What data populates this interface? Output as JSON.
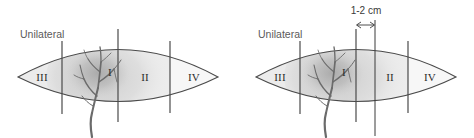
{
  "figure": {
    "type": "anatomical-zone-diagram",
    "background_color": "#ffffff",
    "outline_color": "#4a4a4a",
    "label_color": "#2b2b2b",
    "side_label_color": "#5a5a5a",
    "tree_color": "#6b6b6b",
    "blob_color": "#b8b8b8"
  },
  "panels": [
    {
      "id": "left-panel",
      "side_label": "Unilateral",
      "zones": [
        {
          "label": "III",
          "order": 1
        },
        {
          "label": "I",
          "order": 2
        },
        {
          "label": "II",
          "order": 3
        },
        {
          "label": "IV",
          "order": 4
        }
      ],
      "has_measurement": false,
      "measurement": ""
    },
    {
      "id": "right-panel",
      "side_label": "Unilateral",
      "zones": [
        {
          "label": "III",
          "order": 1
        },
        {
          "label": "I",
          "order": 2
        },
        {
          "label": "II",
          "order": 3
        },
        {
          "label": "IV",
          "order": 4
        }
      ],
      "has_measurement": true,
      "measurement": "1-2 cm"
    }
  ]
}
